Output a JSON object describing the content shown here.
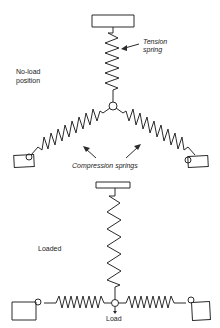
{
  "diagram": {
    "top": {
      "state_label_line1": "No-load",
      "state_label_line2": "position",
      "tension_label_line1": "Tension",
      "tension_label_line2": "spring",
      "compression_label": "Compression springs"
    },
    "bottom": {
      "state_label": "Loaded",
      "load_label": "Load"
    },
    "colors": {
      "line": "#2a2a2a",
      "background": "#ffffff"
    }
  }
}
